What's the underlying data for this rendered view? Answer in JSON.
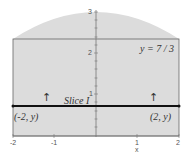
{
  "diagram": {
    "axis": {
      "x_label": "x",
      "x_ticks": [
        "-2",
        "-1",
        "1",
        "2"
      ],
      "y_ticks": [
        "1",
        "2",
        "3"
      ]
    },
    "labels": {
      "line_label": "y = 7 / 3",
      "slice_label": "Slice I",
      "left_point": "(-2, y)",
      "right_point": "(2, y)"
    },
    "arrows": {
      "left": "↑",
      "right": "↑"
    },
    "colors": {
      "fill": "#dcdcdc",
      "outline": "#555555",
      "slice": "#111111",
      "axis": "#666666"
    }
  }
}
